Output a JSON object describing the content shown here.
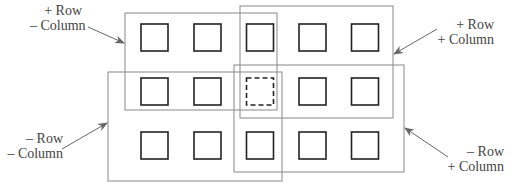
{
  "diagram": {
    "grid": {
      "rows": 3,
      "columns": 5,
      "highlighted_cell": {
        "row": 2,
        "column": 3,
        "style": "dashed"
      }
    },
    "colors": {
      "square_stroke": "#222222",
      "region_stroke": "#888888",
      "arrow": "#666666",
      "text": "#444444"
    },
    "regions": [
      {
        "id": "plus-row-minus-column",
        "label_line1": "+ Row",
        "label_line2": "– Column"
      },
      {
        "id": "plus-row-plus-column",
        "label_line1": "+ Row",
        "label_line2": "+ Column"
      },
      {
        "id": "minus-row-minus-column",
        "label_line1": "– Row",
        "label_line2": "– Column"
      },
      {
        "id": "minus-row-plus-column",
        "label_line1": "– Row",
        "label_line2": "+ Column"
      }
    ]
  }
}
